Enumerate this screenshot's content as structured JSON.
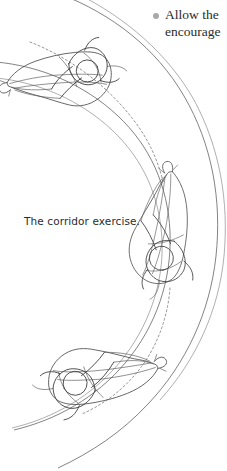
{
  "page": {
    "background_color": "#ffffff",
    "width": 227,
    "height": 471
  },
  "bullet_note": {
    "marker_color": "#a8a8a8",
    "line1": "Allow the",
    "line2": "encourage",
    "truncated": true
  },
  "caption": {
    "text": "The corridor exercise."
  },
  "figure": {
    "title": "The corridor exercise.",
    "line_color": "#4a4a4a",
    "corridor_color": "#6d6d6d",
    "track_color": "#7b7b7b",
    "horses": [
      {
        "id": "horse-top",
        "label": "horse-and-rider-top",
        "heading": "upper-left"
      },
      {
        "id": "horse-middle",
        "label": "horse-and-rider-middle",
        "heading": "up"
      },
      {
        "id": "horse-bottom",
        "label": "horse-and-rider-bottom",
        "heading": "upper-right"
      }
    ],
    "corridor_walls": [
      {
        "id": "inner-wall",
        "label": "inner-corridor-wall"
      },
      {
        "id": "outer-wall",
        "label": "outer-corridor-wall"
      }
    ],
    "track_segments": [
      {
        "id": "track-upper",
        "label": "dashed-track-upper"
      },
      {
        "id": "track-lower",
        "label": "dashed-track-lower"
      }
    ]
  }
}
